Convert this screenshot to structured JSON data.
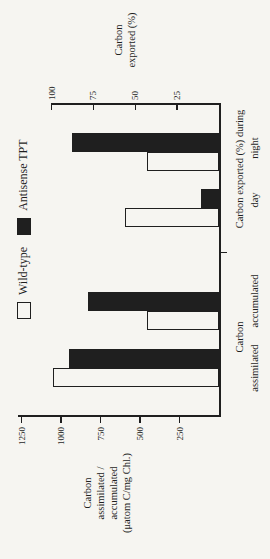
{
  "figure": {
    "background": "#f6f5f1",
    "ink": "#1f1f1f"
  },
  "legend": {
    "items": [
      {
        "label": "Wild-type",
        "swatch": "open"
      },
      {
        "label": "Antisense TPT",
        "swatch": "filled"
      }
    ]
  },
  "chart_data": {
    "type": "bar",
    "rotation": "whole figure rotated 90deg counter-clockwise",
    "grid": false,
    "legend_position": "top",
    "categories": [
      "Carbon assimilated",
      "Carbon accumulated",
      "Carbon exported (%) during day",
      "Carbon exported (%) during night"
    ],
    "value_axis_for_category": [
      "left",
      "left",
      "right",
      "right"
    ],
    "series": [
      {
        "name": "Wild-type",
        "fill": "open",
        "values": [
          1050,
          455,
          56,
          43
        ]
      },
      {
        "name": "Antisense TPT",
        "fill": "filled",
        "values": [
          950,
          830,
          11,
          88
        ]
      }
    ],
    "left_axis": {
      "title_lines": [
        "Carbon",
        "assimilated /",
        "accumulated",
        "(μatom C/mg Chl.)"
      ],
      "ticks": [
        250,
        500,
        750,
        1000,
        1250
      ],
      "range": [
        0,
        1300
      ]
    },
    "right_axis": {
      "title_lines": [
        "Carbon",
        "exported (%)"
      ],
      "ticks": [
        25,
        50,
        75,
        100
      ],
      "range": [
        0,
        100
      ]
    },
    "category_axis": {
      "group_label_line1": [
        "Carbon",
        "Carbon exported (%) during"
      ],
      "group_label_line2": [
        "assimilated",
        "accumulated",
        "day",
        "night"
      ]
    }
  }
}
